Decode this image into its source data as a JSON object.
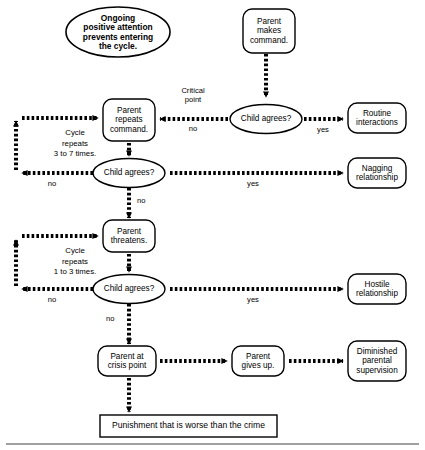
{
  "diagram": {
    "colors": {
      "ink": "#000000",
      "background": "#ffffff",
      "rule": "#808080"
    },
    "nodes": {
      "ongoing_attention": {
        "id": "ongoing-attention",
        "shape": "ellipse",
        "text": "Ongoing\npositive attention\nprevents entering\nthe cycle.",
        "lines": [
          "Ongoing",
          "positive attention",
          "prevents entering",
          "the cycle."
        ]
      },
      "parent_makes_command": {
        "id": "parent-makes-command",
        "shape": "rounded-rect",
        "text": "Parent\nmakes\ncommand.",
        "lines": [
          "Parent",
          "makes",
          "command."
        ]
      },
      "parent_repeats_command": {
        "id": "parent-repeats-command",
        "shape": "rounded-rect",
        "text": "Parent\nrepeats\ncommand.",
        "lines": [
          "Parent",
          "repeats",
          "command."
        ]
      },
      "child_agrees_1": {
        "id": "child-agrees-1",
        "shape": "ellipse",
        "text": "Child agrees?"
      },
      "child_agrees_2": {
        "id": "child-agrees-2",
        "shape": "ellipse",
        "text": "Child agrees?"
      },
      "child_agrees_3": {
        "id": "child-agrees-3",
        "shape": "ellipse",
        "text": "Child agrees?"
      },
      "routine_interactions": {
        "id": "routine-interactions",
        "shape": "rounded-rect",
        "text": "Routine\ninteractions",
        "lines": [
          "Routine",
          "interactions"
        ]
      },
      "nagging_relationship": {
        "id": "nagging-relationship",
        "shape": "rounded-rect",
        "text": "Nagging\nrelationship",
        "lines": [
          "Nagging",
          "relationship"
        ]
      },
      "parent_threatens": {
        "id": "parent-threatens",
        "shape": "rounded-rect",
        "text": "Parent\nthreatens.",
        "lines": [
          "Parent",
          "threatens."
        ]
      },
      "hostile_relationship": {
        "id": "hostile-relationship",
        "shape": "rounded-rect",
        "text": "Hostile\nrelationship",
        "lines": [
          "Hostile",
          "relationship"
        ]
      },
      "parent_at_crisis_point": {
        "id": "parent-at-crisis-point",
        "shape": "rounded-rect",
        "text": "Parent at\ncrisis point",
        "lines": [
          "Parent at",
          "crisis point"
        ]
      },
      "parent_gives_up": {
        "id": "parent-gives-up",
        "shape": "rounded-rect",
        "text": "Parent\ngives up.",
        "lines": [
          "Parent",
          "gives up."
        ]
      },
      "diminished_supervision": {
        "id": "diminished-parental-supervision",
        "shape": "rounded-rect",
        "text": "Diminished\nparental\nsupervision",
        "lines": [
          "Diminished",
          "parental",
          "supervision"
        ]
      },
      "punishment": {
        "id": "punishment-outcome",
        "shape": "rect",
        "text": "Punishment that is worse than the crime"
      }
    },
    "edge_labels": {
      "critical_point": "Critical\npoint",
      "critical_point_lines": [
        "Critical",
        "point"
      ],
      "no_1": "no",
      "yes_1": "yes",
      "no_2": "no",
      "yes_2": "yes",
      "no_cycle_1": "no",
      "no_3": "no",
      "yes_3": "yes",
      "no_cycle_2": "no",
      "no_4": "no"
    },
    "cycle_notes": {
      "cycle_1": "Cycle\nrepeats\n3 to 7 times.",
      "cycle_1_lines": [
        "Cycle",
        "repeats",
        "3 to 7 times."
      ],
      "cycle_2": "Cycle\nrepeats\n1 to 3 times.",
      "cycle_2_lines": [
        "Cycle",
        "repeats",
        "1 to 3 times."
      ]
    }
  }
}
